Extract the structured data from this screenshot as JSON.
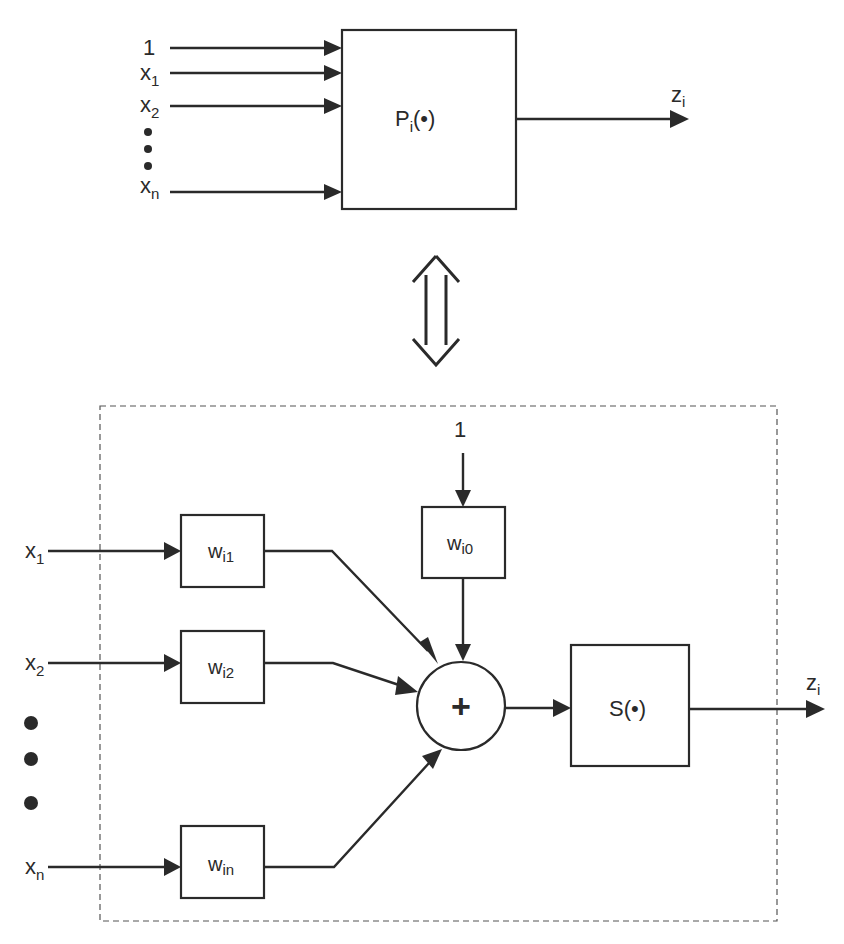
{
  "top": {
    "block_label": "P",
    "block_label_sub": "i",
    "block_label_arg": "(•)",
    "inputs": [
      {
        "label": "1",
        "sub": ""
      },
      {
        "label": "x",
        "sub": "1"
      },
      {
        "label": "x",
        "sub": "2"
      },
      {
        "label": "x",
        "sub": "n"
      }
    ],
    "output": {
      "label": "z",
      "sub": "i"
    }
  },
  "equivalence": {
    "symbol": "double-arrow"
  },
  "bottom": {
    "bias_input": "1",
    "bias_weight": {
      "label": "w",
      "sub": "i0"
    },
    "inputs": [
      {
        "label": "x",
        "sub": "1",
        "weight": "w",
        "weight_sub": "i1"
      },
      {
        "label": "x",
        "sub": "2",
        "weight": "w",
        "weight_sub": "i2"
      },
      {
        "label": "x",
        "sub": "n",
        "weight": "w",
        "weight_sub": "in"
      }
    ],
    "summer": "+",
    "activation": {
      "label": "S",
      "arg": "(•)"
    },
    "output": {
      "label": "z",
      "sub": "i"
    }
  },
  "colors": {
    "stroke": "#2a2a2a",
    "background": "#ffffff"
  }
}
